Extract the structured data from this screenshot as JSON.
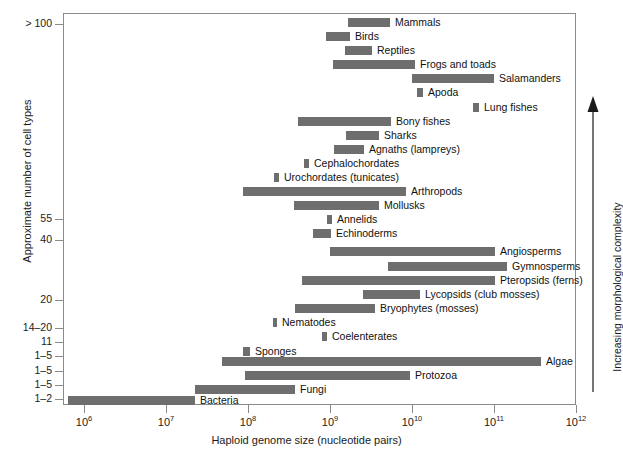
{
  "chart_data": {
    "type": "bar",
    "orientation": "horizontal-range",
    "title": "",
    "xlabel": "Haploid genome size (nucleotide pairs)",
    "ylabel": "Approximate number of cell types",
    "right_axis_annotation": "Increasing morphological complexity",
    "xscale": "log",
    "xlim": [
      1000000,
      1000000000000
    ],
    "x_tick_labels": [
      "10⁶",
      "10⁷",
      "10⁸",
      "10⁹",
      "10¹⁰",
      "10¹¹",
      "10¹²"
    ],
    "x_tick_mantissa": [
      "10",
      "10",
      "10",
      "10",
      "10",
      "10",
      "10"
    ],
    "x_tick_exponents": [
      "6",
      "7",
      "8",
      "9",
      "10",
      "11",
      "12"
    ],
    "x_tick_values": [
      1000000.0,
      10000000.0,
      100000000.0,
      1000000000.0,
      10000000000.0,
      100000000000.0,
      1000000000000.0
    ],
    "grid": false,
    "legend": "none",
    "bar_color": "#6e6e6e",
    "frame_color": "#8a8a8a",
    "y_tick_labels": [
      "> 100",
      "55",
      "40",
      "20",
      "14–20",
      "11",
      "1–5",
      "1–5",
      "1–5",
      "1–2"
    ],
    "y_tick_py": [
      24,
      219,
      240,
      300,
      328,
      342,
      356,
      371,
      385,
      399
    ],
    "bars": [
      {
        "label": "Mammals",
        "x_start": 2100000000.0,
        "x_end": 4300000000.0,
        "label_side": "right",
        "row_py": 18,
        "px_start": 348,
        "px_end": 390
      },
      {
        "label": "Birds",
        "x_start": 1100000000.0,
        "x_end": 1800000000.0,
        "label_side": "right",
        "row_py": 32,
        "px_start": 326,
        "px_end": 350
      },
      {
        "label": "Reptiles",
        "x_start": 1600000000.0,
        "x_end": 2800000000.0,
        "label_side": "right",
        "row_py": 46,
        "px_start": 345,
        "px_end": 372
      },
      {
        "label": "Frogs and toads",
        "x_start": 1000000000.0,
        "x_end": 10000000000.0,
        "label_side": "right",
        "row_py": 60,
        "px_start": 333,
        "px_end": 415
      },
      {
        "label": "Salamanders",
        "x_start": 9000000000.0,
        "x_end": 100000000000.0,
        "label_side": "right",
        "row_py": 74,
        "px_start": 412,
        "px_end": 494
      },
      {
        "label": "Apoda",
        "x_start": 11000000000.0,
        "x_end": 14000000000.0,
        "label_side": "right",
        "row_py": 88,
        "px_start": 417,
        "px_end": 423
      },
      {
        "label": "Lung fishes",
        "x_start": 50000000000.0,
        "x_end": 65000000000.0,
        "label_side": "right",
        "row_py": 103,
        "px_start": 473,
        "px_end": 479
      },
      {
        "label": "Bony fishes",
        "x_start": 400000000.0,
        "x_end": 4500000000.0,
        "label_side": "right",
        "row_py": 117,
        "px_start": 298,
        "px_end": 391
      },
      {
        "label": "Sharks",
        "x_start": 2000000000.0,
        "x_end": 5000000000.0,
        "label_side": "right",
        "row_py": 131,
        "px_start": 346,
        "px_end": 379
      },
      {
        "label": "Agnaths (lampreys)",
        "x_start": 1300000000.0,
        "x_end": 3000000000.0,
        "label_side": "right",
        "row_py": 145,
        "px_start": 334,
        "px_end": 364
      },
      {
        "label": "Cephalochordates",
        "x_start": 600000000.0,
        "x_end": 750000000.0,
        "label_side": "right",
        "row_py": 159,
        "px_start": 304,
        "px_end": 309
      },
      {
        "label": "Urochordates (tunicates)",
        "x_start": 230000000.0,
        "x_end": 290000000.0,
        "label_side": "right",
        "row_py": 173,
        "px_start": 274,
        "px_end": 279
      },
      {
        "label": "Arthropods",
        "x_start": 90000000.0,
        "x_end": 9000000000.0,
        "label_side": "right",
        "row_py": 187,
        "px_start": 243,
        "px_end": 406
      },
      {
        "label": "Mollusks",
        "x_start": 350000000.0,
        "x_end": 5000000000.0,
        "label_side": "right",
        "row_py": 201,
        "px_start": 294,
        "px_end": 379
      },
      {
        "label": "Annelids",
        "x_start": 1100000000.0,
        "x_end": 1400000000.0,
        "label_side": "right",
        "row_py": 215,
        "px_start": 327,
        "px_end": 332
      },
      {
        "label": "Echinoderms",
        "x_start": 550000000.0,
        "x_end": 1200000000.0,
        "label_side": "right",
        "row_py": 229,
        "px_start": 313,
        "px_end": 331
      },
      {
        "label": "Angiosperms",
        "x_start": 1000000000.0,
        "x_end": 100000000000.0,
        "label_side": "right",
        "row_py": 247,
        "px_start": 330,
        "px_end": 495
      },
      {
        "label": "Gymnosperms",
        "x_start": 6500000000.0,
        "x_end": 200000000000.0,
        "label_side": "right",
        "row_py": 262,
        "px_start": 388,
        "px_end": 507
      },
      {
        "label": "Pteropsids (ferns)",
        "x_start": 500000000.0,
        "x_end": 100000000000.0,
        "label_side": "right",
        "row_py": 276,
        "px_start": 302,
        "px_end": 495
      },
      {
        "label": "Lycopsids (club mosses)",
        "x_start": 3500000000.0,
        "x_end": 13000000000.0,
        "label_side": "right",
        "row_py": 290,
        "px_start": 363,
        "px_end": 420
      },
      {
        "label": "Bryophytes (mosses)",
        "x_start": 260000000.0,
        "x_end": 4000000000.0,
        "label_side": "right",
        "row_py": 304,
        "px_start": 295,
        "px_end": 375
      },
      {
        "label": "Nematodes",
        "x_start": 70000000.0,
        "x_end": 90000000.0,
        "label_side": "right",
        "row_py": 318,
        "px_start": 273,
        "px_end": 277
      },
      {
        "label": "Coelenterates",
        "x_start": 550000000.0,
        "x_end": 700000000.0,
        "label_side": "right",
        "row_py": 332,
        "px_start": 322,
        "px_end": 327
      },
      {
        "label": "Sponges",
        "x_start": 80000000.0,
        "x_end": 110000000.0,
        "label_side": "right",
        "row_py": 347,
        "px_start": 243,
        "px_end": 250
      },
      {
        "label": "Algae",
        "x_start": 60000000.0,
        "x_end": 300000000000.0,
        "label_side": "right",
        "row_py": 357,
        "px_start": 222,
        "px_end": 541
      },
      {
        "label": "Protozoa",
        "x_start": 100000000.0,
        "x_end": 10000000000.0,
        "label_side": "right",
        "row_py": 371,
        "px_start": 245,
        "px_end": 410
      },
      {
        "label": "Fungi",
        "x_start": 8500000.0,
        "x_end": 110000000.0,
        "label_side": "right",
        "row_py": 385,
        "px_start": 195,
        "px_end": 295
      },
      {
        "label": "Bacteria",
        "x_start": 1100000.0,
        "x_end": 27000000.0,
        "label_side": "right",
        "row_py": 396,
        "px_start": 68,
        "px_end": 195
      }
    ]
  },
  "axes": {
    "x": {
      "title": "Haploid genome size (nucleotide pairs)",
      "ticks": [
        {
          "label_base": "10",
          "label_exp": "6",
          "px": 84
        },
        {
          "label_base": "10",
          "label_exp": "7",
          "px": 166
        },
        {
          "label_base": "10",
          "label_exp": "8",
          "px": 248
        },
        {
          "label_base": "10",
          "label_exp": "9",
          "px": 330
        },
        {
          "label_base": "10",
          "label_exp": "10",
          "px": 412
        },
        {
          "label_base": "10",
          "label_exp": "11",
          "px": 494
        },
        {
          "label_base": "10",
          "label_exp": "12",
          "px": 576
        }
      ]
    },
    "y": {
      "title": "Approximate number of cell types",
      "ticks": [
        {
          "label": "> 100",
          "px": 24
        },
        {
          "label": "55",
          "px": 219
        },
        {
          "label": "40",
          "px": 240
        },
        {
          "label": "20",
          "px": 300
        },
        {
          "label": "14–20",
          "px": 328
        },
        {
          "label": "11",
          "px": 342
        },
        {
          "label": "1–5",
          "px": 356
        },
        {
          "label": "1–5",
          "px": 371
        },
        {
          "label": "1–5",
          "px": 385
        },
        {
          "label": "1–2",
          "px": 399
        }
      ]
    }
  },
  "annotations": {
    "complexity_arrow_label": "Increasing morphological complexity"
  },
  "colors": {
    "bar": "#6e6e6e",
    "frame": "#8a8a8a",
    "text": "#1a1a1a",
    "background": "#ffffff"
  }
}
